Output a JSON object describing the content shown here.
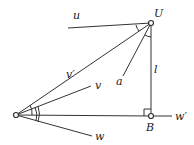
{
  "diagram": {
    "type": "geometric-figure",
    "labels": {
      "u": "u",
      "U": "U",
      "v_prime": "v′",
      "v": "v",
      "a": "a",
      "l": "l",
      "w_prime": "w′",
      "w": "w",
      "B": "B"
    },
    "points": {
      "origin": [
        16,
        115
      ],
      "U": [
        151,
        23
      ],
      "B": [
        151,
        116
      ]
    },
    "colors": {
      "stroke": "#333333",
      "background": "#ffffff"
    }
  }
}
